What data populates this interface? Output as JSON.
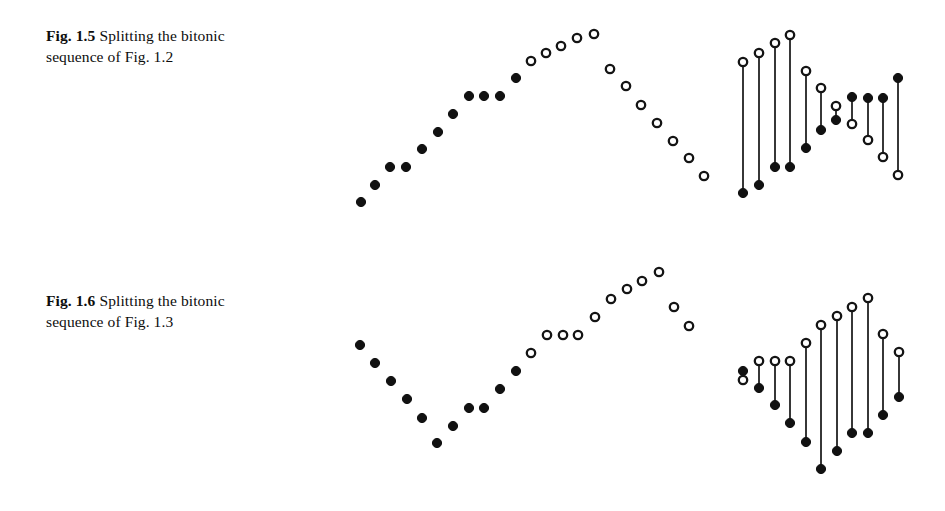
{
  "document": {
    "background_color": "#ffffff",
    "ink_color": "#111111"
  },
  "figures": [
    {
      "id": "fig-1-5",
      "label": "Fig. 1.5",
      "caption_text": "Splitting the bitonic sequence of Fig. 1.2",
      "caption_line_1": "Splitting the bitonic",
      "caption_line_2": "sequence of Fig. 1.2"
    },
    {
      "id": "fig-1-6",
      "label": "Fig. 1.6",
      "caption_text": "Splitting the bitonic sequence of Fig. 1.3",
      "caption_line_1": "Splitting the bitonic",
      "caption_line_2": "sequence of Fig. 1.3"
    }
  ],
  "chart_data": [
    {
      "id": "fig-1-5-scatter",
      "type": "scatter",
      "title": "Fig. 1.5 bitonic sequence (left panel)",
      "xlabel": "",
      "ylabel": "",
      "grid": false,
      "legend": "none",
      "xlim": [
        0,
        380
      ],
      "ylim": [
        0,
        230
      ],
      "note": "y values are screen coordinates measured downward; larger y = lower on page",
      "series": [
        {
          "name": "filled",
          "marker": "filled-circle",
          "color": "#111111",
          "points": [
            {
              "x": 21,
              "y": 202
            },
            {
              "x": 35,
              "y": 185
            },
            {
              "x": 50,
              "y": 167
            },
            {
              "x": 66,
              "y": 167
            },
            {
              "x": 82,
              "y": 149
            },
            {
              "x": 98,
              "y": 132
            },
            {
              "x": 113,
              "y": 114
            },
            {
              "x": 129,
              "y": 96
            },
            {
              "x": 144,
              "y": 96
            },
            {
              "x": 160,
              "y": 96
            },
            {
              "x": 176,
              "y": 78
            }
          ]
        },
        {
          "name": "open",
          "marker": "open-circle",
          "color": "#141414",
          "points": [
            {
              "x": 191,
              "y": 61
            },
            {
              "x": 206,
              "y": 53
            },
            {
              "x": 221,
              "y": 46
            },
            {
              "x": 237,
              "y": 38
            },
            {
              "x": 254,
              "y": 34
            },
            {
              "x": 270,
              "y": 69
            },
            {
              "x": 286,
              "y": 86
            },
            {
              "x": 301,
              "y": 105
            },
            {
              "x": 317,
              "y": 123
            },
            {
              "x": 333,
              "y": 141
            },
            {
              "x": 349,
              "y": 158
            },
            {
              "x": 364,
              "y": 176
            }
          ]
        }
      ]
    },
    {
      "id": "fig-1-5-stems",
      "type": "stem",
      "title": "Fig. 1.5 split pairs (right panel)",
      "xlabel": "",
      "ylabel": "",
      "grid": false,
      "legend": "none",
      "xlim": [
        0,
        200
      ],
      "ylim": [
        0,
        230
      ],
      "note": "each stem joins one element of the low half (filled) to its partner in the high half (open)",
      "stems": [
        {
          "x": 23,
          "top_y": 62,
          "top_marker": "open",
          "bottom_y": 193,
          "bottom_marker": "filled"
        },
        {
          "x": 39,
          "top_y": 53,
          "top_marker": "open",
          "bottom_y": 185,
          "bottom_marker": "filled"
        },
        {
          "x": 55,
          "top_y": 43,
          "top_marker": "open",
          "bottom_y": 167,
          "bottom_marker": "filled"
        },
        {
          "x": 70,
          "top_y": 35,
          "top_marker": "open",
          "bottom_y": 167,
          "bottom_marker": "filled"
        },
        {
          "x": 86,
          "top_y": 71,
          "top_marker": "open",
          "bottom_y": 148,
          "bottom_marker": "filled"
        },
        {
          "x": 101,
          "top_y": 88,
          "top_marker": "open",
          "bottom_y": 130,
          "bottom_marker": "filled"
        },
        {
          "x": 116,
          "top_y": 106,
          "top_marker": "open",
          "bottom_y": 120,
          "bottom_marker": "filled"
        },
        {
          "x": 132,
          "top_y": 97,
          "top_marker": "filled",
          "bottom_y": 124,
          "bottom_marker": "open"
        },
        {
          "x": 148,
          "top_y": 98,
          "top_marker": "filled",
          "bottom_y": 140,
          "bottom_marker": "open"
        },
        {
          "x": 163,
          "top_y": 98,
          "top_marker": "filled",
          "bottom_y": 157,
          "bottom_marker": "open"
        },
        {
          "x": 178,
          "top_y": 78,
          "top_marker": "filled",
          "bottom_y": 175,
          "bottom_marker": "open"
        }
      ]
    },
    {
      "id": "fig-1-6-scatter",
      "type": "scatter",
      "title": "Fig. 1.6 bitonic sequence (left panel)",
      "xlabel": "",
      "ylabel": "",
      "grid": false,
      "legend": "none",
      "xlim": [
        0,
        380
      ],
      "ylim": [
        0,
        230
      ],
      "note": "y values are screen coordinates measured downward; larger y = lower on page",
      "series": [
        {
          "name": "filled",
          "marker": "filled-circle",
          "color": "#111111",
          "points": [
            {
              "x": 20,
              "y": 89
            },
            {
              "x": 35,
              "y": 107
            },
            {
              "x": 51,
              "y": 125
            },
            {
              "x": 67,
              "y": 143
            },
            {
              "x": 82,
              "y": 162
            },
            {
              "x": 113,
              "y": 170
            },
            {
              "x": 97,
              "y": 187
            },
            {
              "x": 129,
              "y": 152
            },
            {
              "x": 144,
              "y": 152
            },
            {
              "x": 160,
              "y": 133
            },
            {
              "x": 176,
              "y": 115
            }
          ]
        },
        {
          "name": "open",
          "marker": "open-circle",
          "color": "#141414",
          "points": [
            {
              "x": 191,
              "y": 97
            },
            {
              "x": 207,
              "y": 79
            },
            {
              "x": 223,
              "y": 79
            },
            {
              "x": 238,
              "y": 79
            },
            {
              "x": 255,
              "y": 61
            },
            {
              "x": 271,
              "y": 43
            },
            {
              "x": 287,
              "y": 33
            },
            {
              "x": 302,
              "y": 25
            },
            {
              "x": 319,
              "y": 16
            },
            {
              "x": 334,
              "y": 51
            },
            {
              "x": 349,
              "y": 70
            }
          ]
        }
      ]
    },
    {
      "id": "fig-1-6-stems",
      "type": "stem",
      "title": "Fig. 1.6 split pairs (right panel)",
      "xlabel": "",
      "ylabel": "",
      "grid": false,
      "legend": "none",
      "xlim": [
        0,
        200
      ],
      "ylim": [
        0,
        230
      ],
      "note": "each stem joins one element of the low half (filled) to its partner in the high half (open)",
      "stems": [
        {
          "x": 23,
          "top_y": 115,
          "top_marker": "filled",
          "bottom_y": 124,
          "bottom_marker": "open"
        },
        {
          "x": 39,
          "top_y": 105,
          "top_marker": "open",
          "bottom_y": 132,
          "bottom_marker": "filled"
        },
        {
          "x": 55,
          "top_y": 105,
          "top_marker": "open",
          "bottom_y": 149,
          "bottom_marker": "filled"
        },
        {
          "x": 70,
          "top_y": 105,
          "top_marker": "open",
          "bottom_y": 167,
          "bottom_marker": "filled"
        },
        {
          "x": 86,
          "top_y": 87,
          "top_marker": "open",
          "bottom_y": 186,
          "bottom_marker": "filled"
        },
        {
          "x": 101,
          "top_y": 69,
          "top_marker": "open",
          "bottom_y": 213,
          "bottom_marker": "filled"
        },
        {
          "x": 117,
          "top_y": 60,
          "top_marker": "open",
          "bottom_y": 195,
          "bottom_marker": "filled"
        },
        {
          "x": 132,
          "top_y": 51,
          "top_marker": "open",
          "bottom_y": 177,
          "bottom_marker": "filled"
        },
        {
          "x": 148,
          "top_y": 42,
          "top_marker": "open",
          "bottom_y": 177,
          "bottom_marker": "filled"
        },
        {
          "x": 163,
          "top_y": 78,
          "top_marker": "open",
          "bottom_y": 159,
          "bottom_marker": "filled"
        },
        {
          "x": 179,
          "top_y": 96,
          "top_marker": "open",
          "bottom_y": 141,
          "bottom_marker": "filled"
        }
      ]
    }
  ]
}
